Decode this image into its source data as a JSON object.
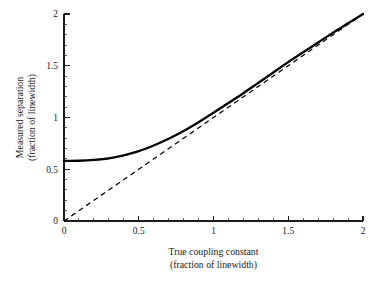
{
  "chart_data": {
    "type": "line",
    "title": "",
    "xlabel": "True coupling constant (fraction of linewidth)",
    "xlabel_line1": "True coupling constant",
    "xlabel_line2": "(fraction of linewidth)",
    "ylabel": "Measured separation (fraction of linewidth)",
    "ylabel_line1": "Measured separation",
    "ylabel_line2": "(fraction of linewidth)",
    "xlim": [
      0,
      2
    ],
    "ylim": [
      0,
      2
    ],
    "xticks": [
      0,
      0.5,
      1,
      1.5,
      2
    ],
    "xtick_labels": [
      "0",
      "0.5",
      "1",
      "1.5",
      "2"
    ],
    "yticks": [
      0,
      0.5,
      1,
      1.5,
      2
    ],
    "ytick_labels": [
      "0",
      "0.5",
      "1",
      "1.5",
      "2"
    ],
    "minor_tick_interval": 0.1,
    "grid": false,
    "legend": "none",
    "series": [
      {
        "name": "measured separation",
        "style": "solid",
        "color": "#000000",
        "x": [
          0.0,
          0.1,
          0.2,
          0.3,
          0.4,
          0.5,
          0.6,
          0.7,
          0.8,
          0.9,
          1.0,
          1.1,
          1.2,
          1.3,
          1.4,
          1.5,
          1.6,
          1.7,
          1.8,
          1.9,
          2.0
        ],
        "y": [
          0.58,
          0.582,
          0.59,
          0.605,
          0.635,
          0.675,
          0.73,
          0.795,
          0.87,
          0.955,
          1.045,
          1.14,
          1.235,
          1.335,
          1.435,
          1.535,
          1.63,
          1.725,
          1.82,
          1.91,
          2.0
        ]
      },
      {
        "name": "identity reference",
        "style": "dashed",
        "color": "#000000",
        "x": [
          0,
          2
        ],
        "y": [
          0,
          2
        ]
      }
    ],
    "annotations": []
  },
  "geometry": {
    "plot_left_px": 64,
    "plot_right_px": 363,
    "plot_bottom_px": 221,
    "plot_top_px": 14
  },
  "colors": {
    "background": "#ffffff",
    "axis": "#1a1a1a",
    "series": "#000000"
  }
}
